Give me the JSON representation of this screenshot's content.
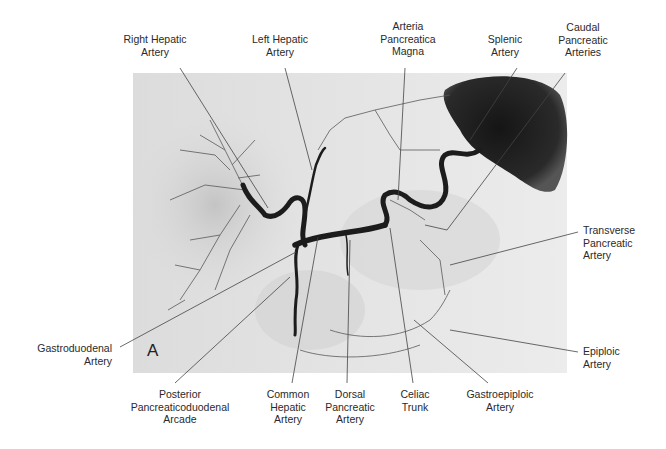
{
  "figure": {
    "panel_letter": "A",
    "image_description": "Celiac angiogram showing celiac trunk and its branches",
    "labels": {
      "right_hepatic": "Right Hepatic\nArtery",
      "left_hepatic": "Left Hepatic\nArtery",
      "arteria_pancreatica_magna": "Arteria\nPancreatica\nMagna",
      "splenic": "Splenic\nArtery",
      "caudal_pancreatic": "Caudal\nPancreatic\nArteries",
      "transverse_pancreatic": "Transverse\nPancreatic\nArtery",
      "epiploic": "Epiploic\nArtery",
      "gastroduodenal": "Gastroduodenal\nArtery",
      "posterior_pancreaticoduodenal": "Posterior\nPancreaticoduodenal\nArcade",
      "common_hepatic": "Common\nHepatic\nArtery",
      "dorsal_pancreatic": "Dorsal\nPancreatic\nArtery",
      "celiac_trunk": "Celiac\nTrunk",
      "gastroepiploic": "Gastroepiploic\nArtery"
    }
  }
}
